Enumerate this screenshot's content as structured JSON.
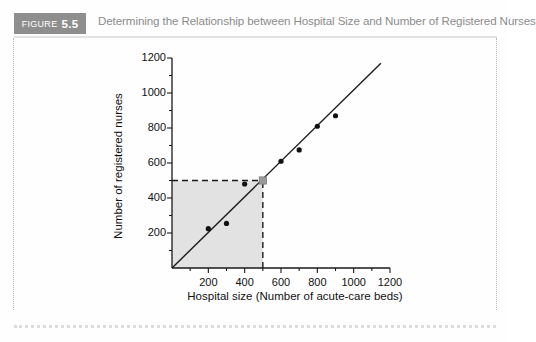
{
  "figure": {
    "badge_label": "FIGURE",
    "badge_number": "5.5",
    "title": "Determining the Relationship between Hospital Size and Number of Registered Nurses",
    "badge_color": "#8e8e8e",
    "title_color": "#8c8c8c",
    "border_color": "#b9b9b9"
  },
  "chart_data": {
    "type": "scatter",
    "title": "",
    "xlabel": "Hospital size (Number of acute-care beds)",
    "ylabel": "Number of registered nurses",
    "xlim": [
      0,
      1200
    ],
    "ylim": [
      0,
      1200
    ],
    "xticks": [
      200,
      400,
      600,
      800,
      1000,
      1200
    ],
    "yticks": [
      200,
      400,
      600,
      800,
      1000,
      1200
    ],
    "xtick_labels": [
      "200",
      "400",
      "600",
      "800",
      "1000",
      "1200"
    ],
    "ytick_labels": [
      "200",
      "400",
      "600",
      "800",
      "1000",
      "1200"
    ],
    "minor_ticks": true,
    "grid": false,
    "legend": "none",
    "points": [
      {
        "x": 200,
        "y": 225
      },
      {
        "x": 300,
        "y": 255
      },
      {
        "x": 400,
        "y": 480
      },
      {
        "x": 600,
        "y": 610
      },
      {
        "x": 700,
        "y": 675
      },
      {
        "x": 800,
        "y": 810
      },
      {
        "x": 900,
        "y": 870
      }
    ],
    "regression_line": {
      "x0": 0,
      "y0": 0,
      "x1": 1150,
      "y1": 1170
    },
    "highlight_point": {
      "x": 500,
      "y": 500,
      "color": "#9a9a9a",
      "shape": "square"
    },
    "shaded_region": {
      "x0": 0,
      "y0": 0,
      "x1": 500,
      "y1": 500,
      "color": "#e2e2e2"
    },
    "dashed_guides": [
      {
        "from": [
          0,
          500
        ],
        "to": [
          500,
          500
        ]
      },
      {
        "from": [
          500,
          0
        ],
        "to": [
          500,
          500
        ]
      }
    ]
  }
}
